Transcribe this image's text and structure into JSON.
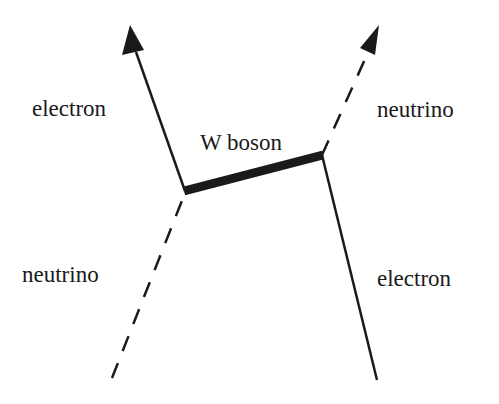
{
  "diagram": {
    "type": "feynman",
    "labels": {
      "top_left": "electron",
      "top_right": "neutrino",
      "propagator": "W boson",
      "bottom_left": "neutrino",
      "bottom_right": "electron"
    },
    "colors": {
      "line": "#1a1a1a",
      "background": "#ffffff"
    },
    "vertices": [
      {
        "id": "v1",
        "x": 185,
        "y": 191
      },
      {
        "id": "v2",
        "x": 322,
        "y": 155
      }
    ],
    "edges": [
      {
        "from": "v1",
        "to": [
          130,
          25
        ],
        "style": "solid",
        "arrow": true,
        "particle": "electron"
      },
      {
        "from": [
          112,
          378
        ],
        "to": "v1",
        "style": "dashed",
        "arrow": false,
        "particle": "neutrino"
      },
      {
        "from": "v1",
        "to": "v2",
        "style": "thick",
        "particle": "W boson"
      },
      {
        "from": "v2",
        "to": [
          378,
          25
        ],
        "style": "dashed",
        "arrow": true,
        "particle": "neutrino"
      },
      {
        "from": [
          377,
          380
        ],
        "to": "v2",
        "style": "solid",
        "arrow": false,
        "particle": "electron"
      }
    ]
  }
}
